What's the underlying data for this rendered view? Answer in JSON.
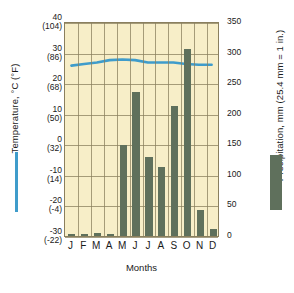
{
  "chart_data": {
    "type": "bar",
    "title": "",
    "subtitle": "",
    "xlabel": "Months",
    "categories": [
      "J",
      "F",
      "M",
      "A",
      "M",
      "J",
      "J",
      "A",
      "S",
      "O",
      "N",
      "D"
    ],
    "month_names": [
      "January",
      "February",
      "March",
      "April",
      "May",
      "June",
      "July",
      "August",
      "September",
      "October",
      "November",
      "December"
    ],
    "grid": true,
    "legend_position": "outside-left-and-right",
    "series": [
      {
        "name": "Precipitation",
        "type": "bar",
        "axis": "right",
        "unit": "mm",
        "color": "#5f705c",
        "values": [
          3,
          3,
          5,
          4,
          148,
          235,
          128,
          113,
          212,
          305,
          42,
          12
        ]
      },
      {
        "name": "Temperature",
        "type": "line",
        "axis": "left",
        "unit": "°C",
        "color": "#3f9ccb",
        "values": [
          26.0,
          26.5,
          27.0,
          27.8,
          28.0,
          27.8,
          27.0,
          27.0,
          27.0,
          26.5,
          26.3,
          26.3
        ]
      }
    ],
    "left_axis": {
      "label": "Temperature, °C (°F)",
      "unit_primary": "°C",
      "unit_secondary": "°F",
      "range": [
        -30,
        40
      ],
      "ticks": [
        {
          "c": "40",
          "f": "(104)"
        },
        {
          "c": "30",
          "f": "(86)"
        },
        {
          "c": "20",
          "f": "(68)"
        },
        {
          "c": "10",
          "f": "(50)"
        },
        {
          "c": "0",
          "f": "(32)"
        },
        {
          "c": "-10",
          "f": "(14)"
        },
        {
          "c": "-20",
          "f": "(-4)"
        },
        {
          "c": "-30",
          "f": "(-22)"
        }
      ]
    },
    "right_axis": {
      "label": "Precipitation, mm (25.4 mm = 1 in.)",
      "unit": "mm",
      "range": [
        0,
        350
      ],
      "ticks": [
        "350",
        "300",
        "250",
        "200",
        "150",
        "100",
        "50",
        "0"
      ]
    },
    "legend": [
      {
        "name": "temperature-legend",
        "label": "Temperature, °C (°F)",
        "marker": "line",
        "color": "#3f9ccb"
      },
      {
        "name": "precipitation-legend",
        "label": "Precipitation, mm (25.4 mm = 1 in.)",
        "marker": "bar",
        "color": "#5f705c"
      }
    ],
    "colors": {
      "plot_background": "#f7eec8",
      "grid": "#8a7f5e",
      "bar": "#5f705c",
      "line": "#3f9ccb",
      "text": "#1a1a1a"
    }
  }
}
